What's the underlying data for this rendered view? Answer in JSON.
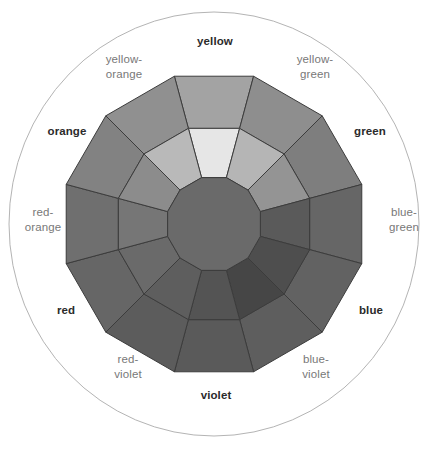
{
  "figure": {
    "name": "color-wheel",
    "background_color": "#ffffff",
    "outer_circle": {
      "stroke_color": "#b4b4b4",
      "stroke_width": 1,
      "center_x": 214,
      "center_y": 224,
      "radius_x": 205,
      "radius_y": 212
    },
    "wheel": {
      "center_x": 214,
      "center_y": 224,
      "outer_radius": 153,
      "mid_radius": 99,
      "inner_radius": 48,
      "segment_count": 12,
      "edge_stroke_color": "#3c3c3c",
      "edge_stroke_width": 1,
      "core_fill": "#6a6a6a"
    }
  },
  "segments": [
    {
      "id": "yellow",
      "label": "yellow",
      "emphasis": "primary",
      "index": 0,
      "outer_fill": "#a3a3a3",
      "inner_fill": "#e6e6e6"
    },
    {
      "id": "yellow-green",
      "label": "yellow-\ngreen",
      "emphasis": "tertiary",
      "index": 1,
      "outer_fill": "#8e8e8e",
      "inner_fill": "#b5b5b5"
    },
    {
      "id": "green",
      "label": "green",
      "emphasis": "primary",
      "index": 2,
      "outer_fill": "#7e7e7e",
      "inner_fill": "#949494"
    },
    {
      "id": "blue-green",
      "label": "blue-\ngreen",
      "emphasis": "tertiary",
      "index": 3,
      "outer_fill": "#666666",
      "inner_fill": "#5a5a5a"
    },
    {
      "id": "blue",
      "label": "blue",
      "emphasis": "primary",
      "index": 4,
      "outer_fill": "#626262",
      "inner_fill": "#4e4e4e"
    },
    {
      "id": "blue-violet",
      "label": "blue-\nviolet",
      "emphasis": "tertiary",
      "index": 5,
      "outer_fill": "#5e5e5e",
      "inner_fill": "#464646"
    },
    {
      "id": "violet",
      "label": "violet",
      "emphasis": "primary",
      "index": 6,
      "outer_fill": "#5a5a5a",
      "inner_fill": "#545454"
    },
    {
      "id": "red-violet",
      "label": "red-\nviolet",
      "emphasis": "tertiary",
      "index": 7,
      "outer_fill": "#5c5c5c",
      "inner_fill": "#5e5e5e"
    },
    {
      "id": "red",
      "label": "red",
      "emphasis": "primary",
      "index": 8,
      "outer_fill": "#666666",
      "inner_fill": "#6a6a6a"
    },
    {
      "id": "red-orange",
      "label": "red-\norange",
      "emphasis": "tertiary",
      "index": 9,
      "outer_fill": "#6f6f6f",
      "inner_fill": "#767676"
    },
    {
      "id": "orange",
      "label": "orange",
      "emphasis": "primary",
      "index": 10,
      "outer_fill": "#828282",
      "inner_fill": "#8c8c8c"
    },
    {
      "id": "yellow-orange",
      "label": "yellow-\norange",
      "emphasis": "tertiary",
      "index": 11,
      "outer_fill": "#909090",
      "inner_fill": "#b9b9b9"
    }
  ],
  "label_positions": [
    {
      "id": "yellow",
      "left": 176,
      "top": 34,
      "width": 78
    },
    {
      "id": "yellow-green",
      "left": 280,
      "top": 52,
      "width": 70
    },
    {
      "id": "green",
      "left": 340,
      "top": 124,
      "width": 60
    },
    {
      "id": "blue-green",
      "left": 376,
      "top": 205,
      "width": 56
    },
    {
      "id": "blue",
      "left": 346,
      "top": 303,
      "width": 50
    },
    {
      "id": "blue-violet",
      "left": 286,
      "top": 352,
      "width": 60
    },
    {
      "id": "violet",
      "left": 186,
      "top": 388,
      "width": 60
    },
    {
      "id": "red-violet",
      "left": 98,
      "top": 352,
      "width": 60
    },
    {
      "id": "red",
      "left": 42,
      "top": 303,
      "width": 48
    },
    {
      "id": "red-orange",
      "left": 12,
      "top": 205,
      "width": 62
    },
    {
      "id": "orange",
      "left": 36,
      "top": 124,
      "width": 62
    },
    {
      "id": "yellow-orange",
      "left": 88,
      "top": 52,
      "width": 72
    }
  ],
  "chart_data": {
    "type": "pie",
    "categories": [
      "yellow",
      "yellow-green",
      "green",
      "blue-green",
      "blue",
      "blue-violet",
      "violet",
      "red-violet",
      "red",
      "red-orange",
      "orange",
      "yellow-orange"
    ],
    "values": [
      30,
      30,
      30,
      30,
      30,
      30,
      30,
      30,
      30,
      30,
      30,
      30
    ],
    "xlabel": "",
    "ylabel": "",
    "legend_position": "around-perimeter",
    "grid": false
  }
}
